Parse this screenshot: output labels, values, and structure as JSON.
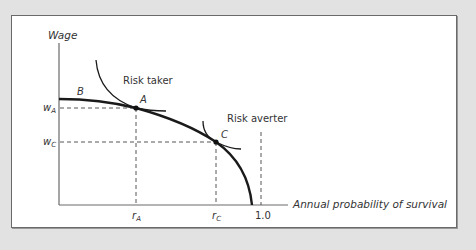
{
  "diagram": {
    "type": "wage-risk tradeoff (hedonic wage function with indifference curves)",
    "y_axis_label": "Wage",
    "x_axis_label": "Annual probability of survival",
    "y_ticks": [
      {
        "base": "w",
        "sub": "A"
      },
      {
        "base": "w",
        "sub": "C"
      }
    ],
    "x_ticks": [
      {
        "base": "r",
        "sub": "A"
      },
      {
        "base": "r",
        "sub": "C"
      },
      {
        "label": "1.0"
      }
    ],
    "points": {
      "A": "A",
      "B": "B",
      "C": "C"
    },
    "curve_labels": {
      "risk_taker": "Risk taker",
      "risk_averter": "Risk averter"
    },
    "colors": {
      "background": "#e2e2e2",
      "panel": "#ffffff",
      "curve": "#1a1a1a",
      "axis": "#555555",
      "dashed": "#444444"
    }
  },
  "labels": {
    "wage": "Wage",
    "x_axis": "Annual probability of survival",
    "w": "w",
    "r": "r",
    "sub_A": "A",
    "sub_C": "C",
    "one": "1.0",
    "B": "B",
    "A": "A",
    "C": "C",
    "risk_taker": "Risk taker",
    "risk_averter": "Risk averter"
  }
}
